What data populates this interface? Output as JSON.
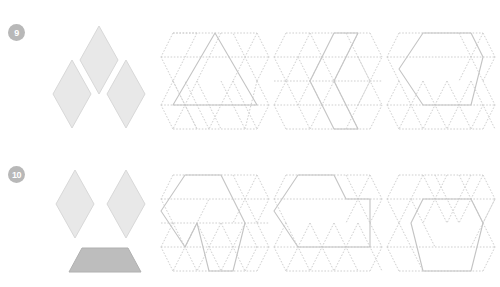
{
  "page": {
    "background_color": "#ffffff",
    "cut_off_header_text": "",
    "worksheet_type": "pattern-block geometry puzzles"
  },
  "colors": {
    "badge_fill": "#b8b8b8",
    "badge_text": "#ffffff",
    "rhombus_fill": "#e8e8e8",
    "rhombus_stroke": "#d8d8d8",
    "trapezoid_fill": "#bdbdbd",
    "trapezoid_stroke": "#b0b0b0",
    "grid_dotted_stroke": "#cfcfcf",
    "outline_solid_stroke": "#c4c4c4"
  },
  "problems": [
    {
      "number": "9",
      "pieces": [
        {
          "shape": "rhombus",
          "name": "rhombus-top",
          "fill": "#e8e8e8"
        },
        {
          "shape": "rhombus",
          "name": "rhombus-left",
          "fill": "#e8e8e8"
        },
        {
          "shape": "rhombus",
          "name": "rhombus-right",
          "fill": "#e8e8e8"
        }
      ],
      "piece_count": 3,
      "grids": [
        {
          "name": "grid-triangle-outline",
          "outline": "large upward triangle"
        },
        {
          "name": "grid-zigzag-outline",
          "outline": "vertical zigzag band"
        },
        {
          "name": "grid-hexagon-outline",
          "outline": "hexagon upper area"
        }
      ]
    },
    {
      "number": "10",
      "pieces": [
        {
          "shape": "rhombus",
          "name": "rhombus-left",
          "fill": "#e8e8e8"
        },
        {
          "shape": "rhombus",
          "name": "rhombus-right",
          "fill": "#e8e8e8"
        },
        {
          "shape": "trapezoid",
          "name": "trapezoid-bottom",
          "fill": "#bdbdbd"
        }
      ],
      "piece_count": 3,
      "grids": [
        {
          "name": "grid-chevron-outline",
          "outline": "hexagon with notch at bottom"
        },
        {
          "name": "grid-notched-hexagon-outline",
          "outline": "hexagon with step notch at right"
        },
        {
          "name": "grid-centered-hexagon-outline",
          "outline": "centered hexagon"
        }
      ]
    }
  ]
}
